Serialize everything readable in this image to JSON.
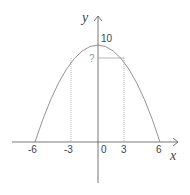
{
  "diagram": {
    "axes": {
      "x_label": "x",
      "y_label": "y",
      "x_ticks": [
        "-6",
        "-3",
        "0",
        "3",
        "6"
      ],
      "y_ticks": [
        "10"
      ]
    },
    "curve": {
      "type": "parabola",
      "vertex": [
        0,
        10
      ],
      "roots": [
        -6,
        6
      ]
    },
    "marked_points": [
      {
        "x": -3,
        "label": ""
      },
      {
        "x": 3,
        "label": "?"
      }
    ],
    "unknown_label": "?",
    "colors": {
      "curve": "#777777",
      "axes": "#555555",
      "guides": "#888888"
    }
  }
}
